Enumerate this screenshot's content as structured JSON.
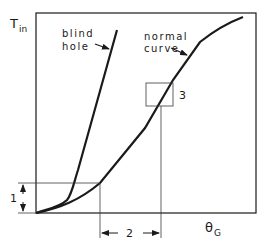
{
  "diagram": {
    "y_axis_label": {
      "main": "T",
      "subscript": "in"
    },
    "x_axis_label": {
      "main": "θ",
      "subscript": "G"
    },
    "curves": [
      {
        "id": "blind-hole",
        "label_line1": "blind",
        "label_line2": "hole"
      },
      {
        "id": "normal",
        "label_line1": "normal",
        "label_line2": "curve"
      }
    ],
    "annotations": {
      "dim1": "1",
      "dim2": "2",
      "box3": "3"
    },
    "colors": {
      "ink": "#1a1a1a",
      "thin": "#3a3a3a",
      "background": "#ffffff"
    }
  }
}
